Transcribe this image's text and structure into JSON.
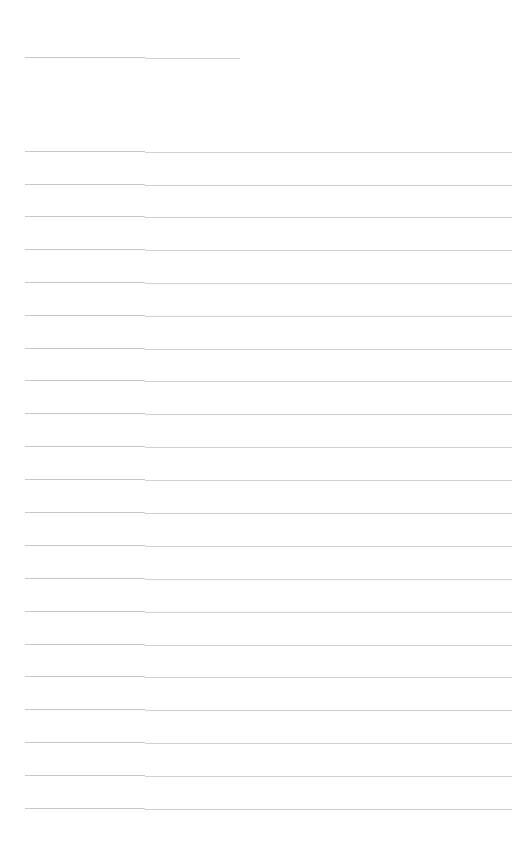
{
  "page": {
    "type": "blank-lined-sheet",
    "background_color": "#ffffff",
    "rule_color": "#c4c4c4"
  },
  "header_line": {
    "y": 57,
    "x_start": 25,
    "x_end": 240
  },
  "ruled_lines": {
    "count": 21,
    "x_start": 25,
    "x_end": 512,
    "spacing": 32.8,
    "y_positions": [
      151,
      184,
      216,
      249,
      282,
      315,
      348,
      380,
      413,
      446,
      479,
      512,
      545,
      578,
      611,
      644,
      676,
      709,
      742,
      775,
      808
    ]
  }
}
